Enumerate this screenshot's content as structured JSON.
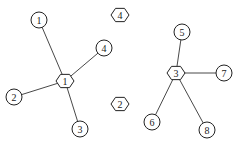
{
  "diagram": {
    "type": "undirected-graph",
    "width": 237,
    "height": 148,
    "colors": {
      "stroke": "#222222",
      "fill": "#ffffff",
      "background": "#ffffff"
    },
    "hexagon_nodes": [
      {
        "id": "H1",
        "label": "1",
        "x": 65,
        "y": 81
      },
      {
        "id": "H2",
        "label": "2",
        "x": 120,
        "y": 104
      },
      {
        "id": "H3",
        "label": "3",
        "x": 176,
        "y": 73
      },
      {
        "id": "H4",
        "label": "4",
        "x": 120,
        "y": 15
      }
    ],
    "circle_nodes": [
      {
        "id": "C1",
        "label": "1",
        "x": 39,
        "y": 20
      },
      {
        "id": "C2",
        "label": "2",
        "x": 14,
        "y": 97
      },
      {
        "id": "C3",
        "label": "3",
        "x": 80,
        "y": 129
      },
      {
        "id": "C4",
        "label": "4",
        "x": 104,
        "y": 48
      },
      {
        "id": "C5",
        "label": "5",
        "x": 182,
        "y": 32
      },
      {
        "id": "C6",
        "label": "6",
        "x": 152,
        "y": 122
      },
      {
        "id": "C7",
        "label": "7",
        "x": 224,
        "y": 73
      },
      {
        "id": "C8",
        "label": "8",
        "x": 207,
        "y": 130
      }
    ],
    "edges": [
      {
        "from": "H1",
        "to": "C1"
      },
      {
        "from": "H1",
        "to": "C2"
      },
      {
        "from": "H1",
        "to": "C3"
      },
      {
        "from": "H1",
        "to": "C4"
      },
      {
        "from": "H3",
        "to": "C5"
      },
      {
        "from": "H3",
        "to": "C6"
      },
      {
        "from": "H3",
        "to": "C7"
      },
      {
        "from": "H3",
        "to": "C8"
      }
    ]
  }
}
